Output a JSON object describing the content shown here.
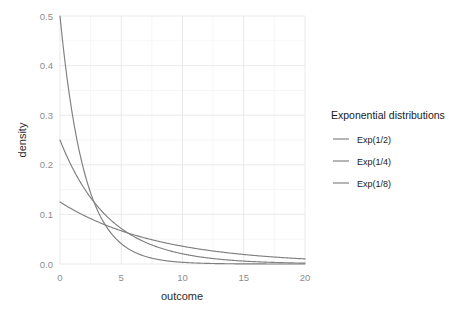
{
  "chart_data": {
    "type": "line",
    "title": "",
    "xlabel": "outcome",
    "ylabel": "density",
    "xlim": [
      0,
      20
    ],
    "ylim": [
      0.0,
      0.5
    ],
    "xticks": [
      0,
      5,
      10,
      15,
      20
    ],
    "xtick_labels": [
      "0",
      "5",
      "10",
      "15",
      "20"
    ],
    "yticks": [
      0.0,
      0.1,
      0.2,
      0.3,
      0.4,
      0.5
    ],
    "ytick_labels": [
      "0.0",
      "0.1",
      "0.2",
      "0.3",
      "0.4",
      "0.5"
    ],
    "grid": true,
    "grid_minor": true,
    "legend_position": "right",
    "legend_title": "Exponential distributions",
    "series": [
      {
        "name": "Exp(1/2)",
        "rate": 0.5,
        "color": "#7f7f7f",
        "x": [
          0,
          0.5,
          1,
          1.5,
          2,
          2.5,
          3,
          3.5,
          4,
          4.5,
          5,
          6,
          7,
          8,
          9,
          10,
          11,
          12,
          13,
          14,
          15,
          16,
          17,
          18,
          19,
          20
        ],
        "values": [
          0.5,
          0.3894,
          0.3033,
          0.2362,
          0.1839,
          0.1433,
          0.1116,
          0.0869,
          0.0677,
          0.0527,
          0.041,
          0.0249,
          0.0151,
          0.0092,
          0.0056,
          0.0034,
          0.002,
          0.0012,
          0.0007,
          0.0005,
          0.0003,
          0.0002,
          0.0001,
          0.0001,
          0.0,
          0.0
        ]
      },
      {
        "name": "Exp(1/4)",
        "rate": 0.25,
        "color": "#7f7f7f",
        "x": [
          0,
          0.5,
          1,
          1.5,
          2,
          2.5,
          3,
          3.5,
          4,
          4.5,
          5,
          6,
          7,
          8,
          9,
          10,
          11,
          12,
          13,
          14,
          15,
          16,
          17,
          18,
          19,
          20
        ],
        "values": [
          0.25,
          0.2206,
          0.1947,
          0.1718,
          0.1516,
          0.1338,
          0.1181,
          0.1042,
          0.092,
          0.0811,
          0.0716,
          0.0558,
          0.0435,
          0.0338,
          0.0264,
          0.0205,
          0.016,
          0.0124,
          0.0097,
          0.0076,
          0.0059,
          0.0046,
          0.0036,
          0.0028,
          0.0022,
          0.0017
        ]
      },
      {
        "name": "Exp(1/8)",
        "rate": 0.125,
        "color": "#7f7f7f",
        "x": [
          0,
          0.5,
          1,
          1.5,
          2,
          2.5,
          3,
          3.5,
          4,
          4.5,
          5,
          6,
          7,
          8,
          9,
          10,
          11,
          12,
          13,
          14,
          15,
          16,
          17,
          18,
          19,
          20
        ],
        "values": [
          0.125,
          0.1174,
          0.1103,
          0.1036,
          0.0974,
          0.0915,
          0.0859,
          0.0807,
          0.0758,
          0.0712,
          0.0669,
          0.0591,
          0.0521,
          0.046,
          0.0406,
          0.0358,
          0.0316,
          0.0279,
          0.0246,
          0.0217,
          0.0191,
          0.0169,
          0.0149,
          0.0132,
          0.0116,
          0.0102
        ]
      }
    ]
  },
  "legend": {
    "title": "Exponential distributions",
    "items": [
      {
        "label": "Exp(1/2)"
      },
      {
        "label": "Exp(1/4)"
      },
      {
        "label": "Exp(1/8)"
      }
    ]
  },
  "axes": {
    "x_title": "outcome",
    "y_title": "density"
  },
  "colors": {
    "line": "#7f7f7f",
    "grid_major": "#e4e4e4",
    "grid_minor": "#f0f0f0",
    "tick_text": "#8c8c8c",
    "axis_title": "#2b2b2b",
    "panel_bg": "#ffffff"
  }
}
